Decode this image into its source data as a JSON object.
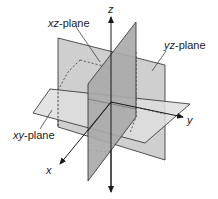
{
  "diagram": {
    "axes": {
      "x": "x",
      "y": "y",
      "z": "z"
    },
    "planes": {
      "xz": {
        "prefix": "xz",
        "suffix": "-plane"
      },
      "yz": {
        "prefix": "yz",
        "suffix": "-plane"
      },
      "xy": {
        "prefix": "xy",
        "suffix": "-plane"
      }
    },
    "colors": {
      "xy_plane_fill": "#d9d9d9",
      "yz_plane_fill": "#c4c4c4",
      "xz_plane_fill": "#a3a3a3",
      "edge": "#2a2a2a",
      "background": "#ffffff"
    }
  }
}
